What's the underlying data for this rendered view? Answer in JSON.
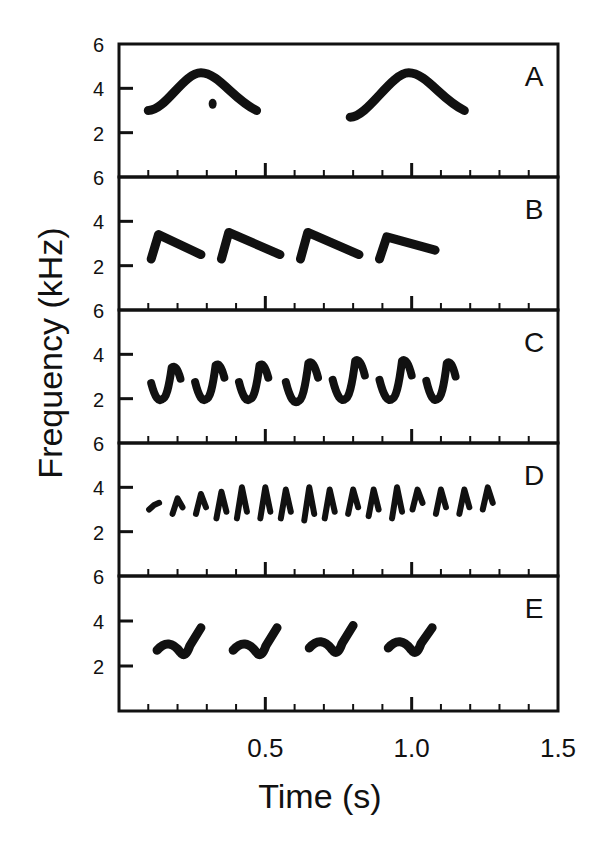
{
  "chart_data": {
    "type": "spectrogram-panels",
    "title": "",
    "xlabel": "Time (s)",
    "ylabel": "Frequency (kHz)",
    "xlim": [
      0,
      1.5
    ],
    "ylim": [
      0,
      6
    ],
    "x_ticks_major": [
      0.5,
      1.0,
      1.5
    ],
    "x_ticks_major_labels": [
      "0.5",
      "1.0",
      "1.5"
    ],
    "x_tick_minor_step": 0.1,
    "y_ticks": [
      2,
      4,
      6
    ],
    "y_tick_labels": [
      "2",
      "4",
      "6"
    ],
    "grid": false,
    "panels": [
      {
        "label": "A",
        "notes": "Two arched notes: rise from ~3 kHz to peak ~4.7 kHz then descend to ~3 kHz",
        "syllables": [
          {
            "t_start": 0.1,
            "t_end": 0.47,
            "f_start": 3.0,
            "f_peak": 4.7,
            "t_peak": 0.28,
            "f_end": 3.0
          },
          {
            "t_start": 0.79,
            "t_end": 1.18,
            "f_start": 2.7,
            "f_peak": 4.7,
            "t_peak": 0.99,
            "f_end": 3.0
          }
        ],
        "extra_fragment": {
          "t": 0.32,
          "f": 3.3
        }
      },
      {
        "label": "B",
        "notes": "Four syllables: sharp rise to ~3.3 kHz then linear descent to ~2.2 kHz",
        "syllables": [
          {
            "t_start": 0.11,
            "t_end": 0.28,
            "f_start": 2.3,
            "f_peak": 3.4,
            "f_end": 2.0
          },
          {
            "t_start": 0.35,
            "t_end": 0.55,
            "f_start": 2.3,
            "f_peak": 3.5,
            "f_end": 2.0
          },
          {
            "t_start": 0.62,
            "t_end": 0.82,
            "f_start": 2.3,
            "f_peak": 3.5,
            "f_end": 2.0
          },
          {
            "t_start": 0.89,
            "t_end": 1.08,
            "f_start": 2.3,
            "f_peak": 3.3,
            "f_end": 2.2
          }
        ]
      },
      {
        "label": "C",
        "notes": "Seven wavy syllables oscillating between ~2 and ~3.6 kHz",
        "syllables": [
          {
            "t_start": 0.11,
            "t_end": 0.21,
            "f_min": 2.0,
            "f_max": 3.4
          },
          {
            "t_start": 0.26,
            "t_end": 0.36,
            "f_min": 2.0,
            "f_max": 3.5
          },
          {
            "t_start": 0.41,
            "t_end": 0.51,
            "f_min": 2.0,
            "f_max": 3.5
          },
          {
            "t_start": 0.57,
            "t_end": 0.68,
            "f_min": 1.9,
            "f_max": 3.6
          },
          {
            "t_start": 0.73,
            "t_end": 0.84,
            "f_min": 2.0,
            "f_max": 3.7
          },
          {
            "t_start": 0.89,
            "t_end": 1.0,
            "f_min": 2.0,
            "f_max": 3.7
          },
          {
            "t_start": 1.05,
            "t_end": 1.15,
            "f_min": 2.0,
            "f_max": 3.6
          }
        ]
      },
      {
        "label": "D",
        "notes": "Rapid trill of 16 short notes, ~3 to ~4 kHz, increasing amplitude",
        "note_times": [
          0.12,
          0.2,
          0.28,
          0.35,
          0.42,
          0.5,
          0.57,
          0.65,
          0.72,
          0.8,
          0.87,
          0.95,
          1.02,
          1.1,
          1.18,
          1.26
        ],
        "f_low": [
          3.0,
          2.8,
          2.8,
          2.6,
          2.6,
          2.6,
          2.6,
          2.5,
          2.6,
          2.8,
          2.7,
          2.6,
          3.0,
          2.8,
          2.8,
          3.0
        ],
        "f_high": [
          3.2,
          3.5,
          3.7,
          3.8,
          4.0,
          4.0,
          3.9,
          4.0,
          3.9,
          3.9,
          3.9,
          4.0,
          3.9,
          3.9,
          3.9,
          4.0
        ]
      },
      {
        "label": "E",
        "notes": "Four syllables: low wave ~2.6 kHz followed by upward sweep to ~3.7 kHz",
        "syllables": [
          {
            "t_start": 0.13,
            "t_end": 0.29,
            "f_min": 2.4,
            "f_max": 3.7
          },
          {
            "t_start": 0.39,
            "t_end": 0.55,
            "f_min": 2.4,
            "f_max": 3.7
          },
          {
            "t_start": 0.65,
            "t_end": 0.81,
            "f_min": 2.5,
            "f_max": 3.8
          },
          {
            "t_start": 0.92,
            "t_end": 1.08,
            "f_min": 2.5,
            "f_max": 3.7
          }
        ]
      }
    ]
  },
  "labels": {
    "xlabel": "Time (s)",
    "ylabel": "Frequency (kHz)",
    "x_tick_labels": [
      "0.5",
      "1.0",
      "1.5"
    ],
    "y_tick_labels": [
      "6",
      "4",
      "2"
    ],
    "panel_letters": [
      "A",
      "B",
      "C",
      "D",
      "E"
    ]
  }
}
